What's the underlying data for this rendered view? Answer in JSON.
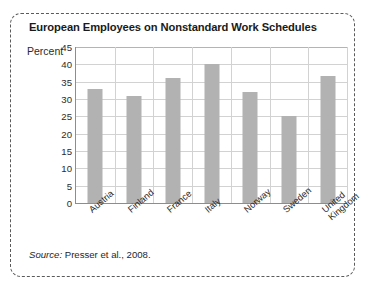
{
  "figure": {
    "title": "European Employees on Nonstandard Work Schedules",
    "axis_unit_label": "Percent",
    "source_prefix": "Source:",
    "source_text": " Presser et al., 2008."
  },
  "chart_data": {
    "type": "bar",
    "title": "European Employees on Nonstandard Work Schedules",
    "xlabel": "",
    "ylabel": "Percent",
    "ylim": [
      0,
      45
    ],
    "ytick_step": 5,
    "yticks": [
      45,
      40,
      35,
      30,
      25,
      20,
      15,
      10,
      5,
      0
    ],
    "grid": true,
    "legend": null,
    "bar_color": "#b2b2b2",
    "categories": [
      "Austria",
      "Finland",
      "France",
      "Italy",
      "Norway",
      "Sweden",
      "United\nKingdom"
    ],
    "values": [
      33,
      31,
      36,
      40,
      32,
      25,
      36.5
    ],
    "source": "Source: Presser et al., 2008."
  }
}
